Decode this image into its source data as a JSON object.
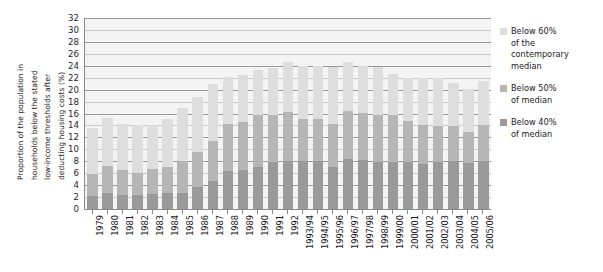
{
  "chart_data": {
    "type": "bar",
    "title": "",
    "subtitle": "",
    "xlabel": "",
    "ylabel": "Proportion of the population in households below the stated low-income thresholds after deducting housing costs (%)",
    "ylabel_lines": [
      "Proportion of the population in",
      "households below the stated",
      "low-income thresholds after",
      "deducting housing costs (%)"
    ],
    "ylim": [
      0,
      32
    ],
    "ytick_step": 2,
    "yticks": [
      32,
      30,
      28,
      26,
      24,
      22,
      20,
      18,
      16,
      14,
      12,
      10,
      8,
      6,
      4,
      2,
      0
    ],
    "grid": true,
    "stacked": true,
    "legend_position": "right",
    "categories": [
      "1979",
      "1980",
      "1981",
      "1982",
      "1983",
      "1984",
      "1985",
      "1986",
      "1987",
      "1988",
      "1989",
      "1990",
      "1991",
      "1992",
      "1993/94",
      "1994/95",
      "1995/96",
      "1996/97",
      "1997/98",
      "1998/99",
      "1999/00",
      "2000/01",
      "2001/02",
      "2002/03",
      "2003/04",
      "2004/05",
      "2005/06"
    ],
    "series": [
      {
        "name": "Below 60% of the contemporary median",
        "color": "#dedede",
        "values": [
          13.6,
          15.3,
          14.2,
          14.0,
          14.1,
          15.1,
          16.9,
          18.7,
          20.9,
          22.2,
          22.5,
          23.3,
          23.7,
          24.6,
          24.0,
          24.0,
          23.8,
          24.7,
          24.0,
          23.8,
          22.7,
          22.0,
          21.9,
          21.9,
          21.1,
          20.1,
          21.5
        ]
      },
      {
        "name": "Below 50% of median",
        "color": "#b6b6b6",
        "values": [
          5.8,
          7.2,
          6.6,
          6.0,
          6.7,
          7.0,
          8.1,
          9.6,
          11.4,
          14.2,
          14.5,
          15.7,
          15.8,
          16.3,
          15.1,
          15.0,
          14.2,
          16.5,
          16.1,
          15.7,
          15.7,
          14.7,
          14.1,
          13.9,
          13.9,
          12.9,
          14.0
        ]
      },
      {
        "name": "Below 40% of median",
        "color": "#9a9a9a",
        "values": [
          2.2,
          2.7,
          2.3,
          2.3,
          2.5,
          2.6,
          2.6,
          3.7,
          4.7,
          6.4,
          6.6,
          7.0,
          7.8,
          8.0,
          8.0,
          8.0,
          7.1,
          8.4,
          8.2,
          7.8,
          7.8,
          7.8,
          7.6,
          7.8,
          8.0,
          7.7,
          8.0
        ]
      }
    ],
    "legend": [
      {
        "label_lines": [
          "Below 60%",
          "of the",
          "contemporary",
          "median"
        ],
        "color": "#dedede"
      },
      {
        "label_lines": [
          "Below 50%",
          "of median"
        ],
        "color": "#b6b6b6"
      },
      {
        "label_lines": [
          "Below 40%",
          "of median"
        ],
        "color": "#9a9a9a"
      }
    ],
    "colors": {
      "plot_background": "#f4f4f4",
      "gridline": "#9a9a9a",
      "axis": "#8a8a8a",
      "text": "#1a1a1a"
    }
  }
}
